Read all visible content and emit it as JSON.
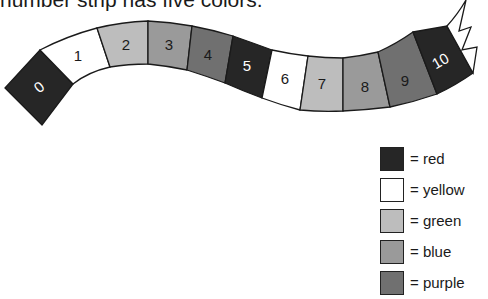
{
  "caption": "number strip has five colors.",
  "colors": {
    "red": "#262626",
    "yellow": "#ffffff",
    "green": "#bdbdbd",
    "blue": "#9a9a9a",
    "purple": "#707070"
  },
  "segments": [
    {
      "number": "0",
      "color": "red"
    },
    {
      "number": "1",
      "color": "yellow"
    },
    {
      "number": "2",
      "color": "green"
    },
    {
      "number": "3",
      "color": "blue"
    },
    {
      "number": "4",
      "color": "purple"
    },
    {
      "number": "5",
      "color": "red"
    },
    {
      "number": "6",
      "color": "yellow"
    },
    {
      "number": "7",
      "color": "green"
    },
    {
      "number": "8",
      "color": "blue"
    },
    {
      "number": "9",
      "color": "purple"
    },
    {
      "number": "10",
      "color": "red"
    }
  ],
  "legend": [
    {
      "color": "red",
      "label": "= red"
    },
    {
      "color": "yellow",
      "label": "= yellow"
    },
    {
      "color": "green",
      "label": "= green"
    },
    {
      "color": "blue",
      "label": "= blue"
    },
    {
      "color": "purple",
      "label": "= purple"
    }
  ]
}
